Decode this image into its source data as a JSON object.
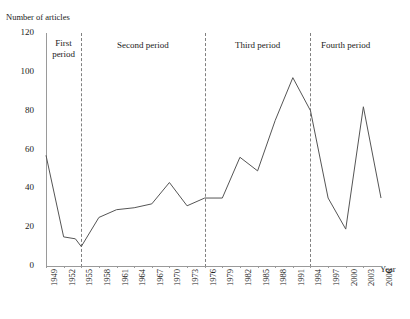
{
  "chart_data": {
    "type": "line",
    "title": "",
    "ylabel": "Number of articles",
    "xlabel": "Year",
    "ylim": [
      0,
      120
    ],
    "ytick_values": [
      0,
      20,
      40,
      60,
      80,
      100,
      120
    ],
    "xlim": [
      1949,
      2006
    ],
    "xtick_labels": [
      "1949",
      "1952",
      "1955",
      "1958",
      "1961",
      "1964",
      "1967",
      "1970",
      "1973",
      "1976",
      "1979",
      "1982",
      "1985",
      "1988",
      "1991",
      "1994",
      "1997",
      "2000",
      "2003",
      "2006"
    ],
    "grid": false,
    "legend": "none",
    "line_color": "#555555",
    "x": [
      1949,
      1952,
      1954,
      1955,
      1958,
      1961,
      1964,
      1967,
      1970,
      1973,
      1976,
      1979,
      1982,
      1985,
      1988,
      1991,
      1994,
      1997,
      2000,
      2003,
      2006
    ],
    "values": [
      57,
      15,
      14,
      10,
      25,
      29,
      30,
      32,
      43,
      31,
      35,
      35,
      56,
      49,
      75,
      97,
      80,
      35,
      19,
      82,
      35
    ],
    "annotations": [
      {
        "label": "First\nperiod",
        "start_year": 1949,
        "end_year": 1955
      },
      {
        "label": "Second period",
        "start_year": 1955,
        "end_year": 1976
      },
      {
        "label": "Third period",
        "start_year": 1976,
        "end_year": 1994
      },
      {
        "label": "Fourth period",
        "start_year": 1994,
        "end_year": 2006
      }
    ],
    "divider_years": [
      1955,
      1976,
      1994
    ]
  }
}
